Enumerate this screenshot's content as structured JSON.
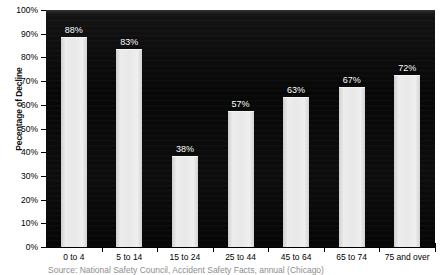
{
  "chart_data": {
    "type": "bar",
    "title": "",
    "subtitle": "",
    "xlabel": "",
    "ylabel": "Pecentage of Decline",
    "categories": [
      "0 to 4",
      "5 to 14",
      "15 to 24",
      "25 to 44",
      "45 to 64",
      "65 to 74",
      "75 and over"
    ],
    "values": [
      88,
      83,
      38,
      57,
      63,
      67,
      72
    ],
    "data_labels": [
      "88%",
      "83%",
      "38%",
      "57%",
      "63%",
      "67%",
      "72%"
    ],
    "ylim": [
      0,
      100
    ],
    "y_ticks": [
      0,
      10,
      20,
      30,
      40,
      50,
      60,
      70,
      80,
      90,
      100
    ],
    "y_tick_labels": [
      "0%",
      "10%",
      "20%",
      "30%",
      "40%",
      "50%",
      "60%",
      "70%",
      "80%",
      "90%",
      "100%"
    ],
    "grid": false,
    "legend": null,
    "series": [
      {
        "name": "Percentage of decline",
        "values": [
          88,
          83,
          38,
          57,
          63,
          67,
          72
        ]
      }
    ],
    "annotations": [],
    "source_note": "Source:  National Safety Council, Accident Safety Facts, annual (Chicago)",
    "colors": {
      "plot_background": "#0b0b0b",
      "bar_fill": "#e8e8e8",
      "bar_edge": "#f4f4f4",
      "data_label": "#ffffff",
      "axis_text": "#000000",
      "source_text": "#8e8e8e",
      "page_background": "#ffffff"
    }
  }
}
